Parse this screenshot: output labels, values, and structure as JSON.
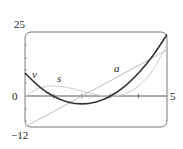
{
  "chart_data": {
    "type": "line",
    "title": "",
    "xlabel": "",
    "ylabel": "",
    "xlim": [
      0,
      5
    ],
    "ylim": [
      -12,
      25
    ],
    "x_tick_labels": [
      "0",
      "5"
    ],
    "y_tick_labels": [
      "25",
      "0",
      "-12"
    ],
    "grid": false,
    "legend": "inline labels",
    "x": [
      0,
      0.5,
      1,
      1.5,
      2,
      2.5,
      3,
      3.5,
      4,
      4.5,
      5
    ],
    "series": [
      {
        "name": "v",
        "color": "#333333",
        "values": [
          9,
          3.75,
          0,
          -2.25,
          -3,
          -2.25,
          0,
          3.75,
          9,
          15.75,
          24
        ]
      },
      {
        "name": "a",
        "color": "#bbbbbb",
        "values": [
          -12,
          -9,
          -6,
          -3,
          0,
          3,
          6,
          9,
          12,
          15,
          18
        ]
      },
      {
        "name": "s",
        "color": "#cccccc",
        "values": [
          0,
          3.125,
          4,
          3.375,
          2,
          0.625,
          0,
          0.875,
          4,
          10.125,
          20
        ]
      }
    ]
  },
  "labels": {
    "y_top": "25",
    "y_zero": "0",
    "y_bottom": "−12",
    "x_right": "5",
    "curve_v": "v",
    "curve_s": "s",
    "curve_a": "a"
  }
}
